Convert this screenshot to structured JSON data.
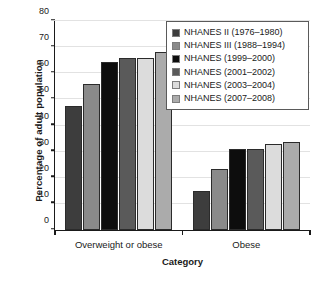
{
  "chart_data": {
    "type": "bar",
    "title": "",
    "xlabel": "Category",
    "ylabel": "Percentage of adult population",
    "categories": [
      "Overweight or obese",
      "Obese"
    ],
    "ylim": [
      0,
      80
    ],
    "yticks": [
      0,
      10,
      20,
      30,
      40,
      50,
      60,
      70,
      80
    ],
    "ytick_labels": [
      "0",
      "10",
      "20",
      "30",
      "40",
      "50",
      "60",
      "70",
      "80"
    ],
    "grid": true,
    "legend_position": "top-right",
    "series": [
      {
        "name": "NHANES II (1976–1980)",
        "color": "#3d3d3d",
        "values": [
          47.4,
          14.8
        ]
      },
      {
        "name": "NHANES III (1988–1994)",
        "color": "#8a8a8a",
        "values": [
          56.0,
          23.2
        ]
      },
      {
        "name": "NHANES (1999–2000)",
        "color": "#0d0d0d",
        "values": [
          64.5,
          30.9
        ]
      },
      {
        "name": "NHANES (2001–2002)",
        "color": "#5a5a5a",
        "values": [
          65.7,
          31.2
        ]
      },
      {
        "name": "NHANES (2003–2004)",
        "color": "#dcdcdc",
        "values": [
          66.0,
          32.9
        ]
      },
      {
        "name": "NHANES (2007–2008)",
        "color": "#ababab",
        "values": [
          68.0,
          33.8
        ]
      }
    ]
  }
}
